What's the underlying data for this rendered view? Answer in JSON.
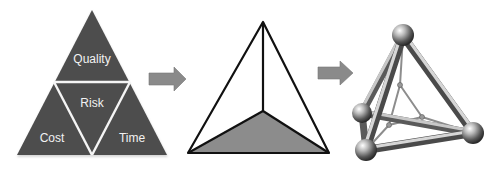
{
  "diagram": {
    "left_triangle": {
      "labels": {
        "top": "Quality",
        "center": "Risk",
        "bottom_left": "Cost",
        "bottom_right": "Time"
      },
      "fill_color": "#4d4d4d",
      "divider_color": "#f5f5f5"
    },
    "arrows": [
      {
        "from": "project-triangle",
        "to": "tetrahedron-outline",
        "color": "#8a8a8a"
      },
      {
        "from": "tetrahedron-outline",
        "to": "tetrahedron-3d-frame",
        "color": "#8a8a8a"
      }
    ],
    "middle_tetrahedron": {
      "stroke_color": "#111111",
      "base_fill": "#8c8c8c"
    },
    "right_frame": {
      "style": "metallic 3D ball-and-rod tetrahedron",
      "metal_color": "#9a9a9a"
    }
  }
}
